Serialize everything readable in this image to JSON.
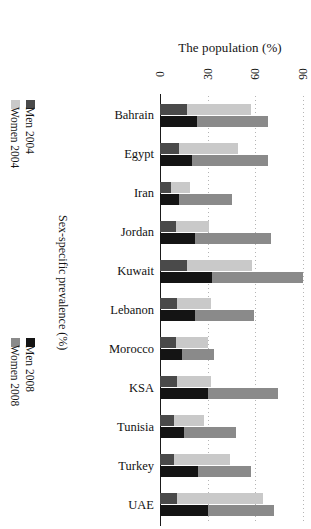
{
  "chart_data": {
    "type": "bar",
    "orientation": "horizontal-stacked-rotated",
    "title": "The population (%)",
    "xlabel": "The population (%)",
    "ylabel": "Sex-specific prevalence (%)",
    "xlim": [
      0,
      95
    ],
    "ticks": [
      0,
      30,
      60,
      90
    ],
    "tick_labels": [
      "0",
      "30",
      "60",
      "90"
    ],
    "grid": true,
    "legend_position": "left-outside",
    "categories": [
      "Bahrain",
      "Egypt",
      "Iran",
      "Jordan",
      "Kuwait",
      "Lebanon",
      "Morocco",
      "KSA",
      "Tunisia",
      "Turkey",
      "UAE"
    ],
    "series": [
      {
        "name": "Men 2004",
        "color": "#4a4a4a",
        "year": "2004",
        "sex": "Men",
        "values": [
          17,
          12,
          7,
          10,
          17,
          11,
          10,
          11,
          9,
          9,
          11
        ]
      },
      {
        "name": "Women 2004",
        "color": "#c9c9c9",
        "year": "2004",
        "sex": "Women",
        "values": [
          40,
          37,
          12,
          21,
          41,
          21,
          20,
          21,
          19,
          35,
          54
        ]
      },
      {
        "name": "Men 2008",
        "color": "#141414",
        "year": "2008",
        "sex": "Men",
        "values": [
          23,
          20,
          12,
          22,
          33,
          22,
          14,
          30,
          15,
          24,
          30
        ]
      },
      {
        "name": "Women 2008",
        "color": "#8a8a8a",
        "year": "2008",
        "sex": "Women",
        "values": [
          45,
          48,
          33,
          48,
          57,
          37,
          20,
          44,
          33,
          33,
          42
        ]
      }
    ],
    "totals_2004": [
      57,
      49,
      19,
      31,
      58,
      32,
      30,
      32,
      28,
      44,
      65
    ],
    "totals_2008": [
      68,
      68,
      45,
      70,
      90,
      59,
      34,
      74,
      48,
      57,
      72
    ]
  },
  "legends": [
    {
      "id": "legend-2004",
      "items": [
        {
          "label": "Women 2004",
          "color": "#c9c9c9"
        },
        {
          "label": "Men 2004",
          "color": "#4a4a4a"
        }
      ]
    },
    {
      "id": "legend-2008",
      "items": [
        {
          "label": "Women 2008",
          "color": "#8a8a8a"
        },
        {
          "label": "Men 2008",
          "color": "#141414"
        }
      ]
    }
  ],
  "axis": {
    "x_title": "The population (%)",
    "y_title": "Sex-specific prevalence (%)"
  }
}
